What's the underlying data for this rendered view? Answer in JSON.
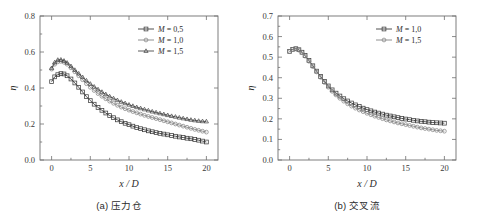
{
  "figure": {
    "panels": [
      {
        "id": "panel-a",
        "caption": "(a) 压力仓",
        "xlabel": "x / D",
        "ylabel": "η"
      },
      {
        "id": "panel-b",
        "caption": "(b) 交叉流",
        "xlabel": "x / D",
        "ylabel": "η"
      }
    ]
  },
  "chart_data": [
    {
      "type": "line",
      "title": "(a) 压力仓",
      "xlabel": "x / D",
      "ylabel": "η",
      "xlim": [
        -1.5,
        21.5
      ],
      "ylim": [
        0.0,
        0.8
      ],
      "xticks": [
        0,
        5,
        10,
        15,
        20
      ],
      "xtick_labels": [
        "0",
        "5",
        "10",
        "15",
        "20"
      ],
      "yticks": [
        0.0,
        0.2,
        0.4,
        0.6,
        0.8
      ],
      "ytick_labels": [
        "0.0",
        "0.2",
        "0.4",
        "0.6",
        "0.8"
      ],
      "grid": false,
      "legend_position": "upper right",
      "series": [
        {
          "name": "M = 0,5",
          "marker": "square",
          "color": "#3d3d3d",
          "x": [
            0.0,
            0.4,
            0.8,
            1.2,
            1.6,
            2.0,
            2.5,
            3.0,
            3.5,
            4.0,
            4.5,
            5.0,
            5.5,
            6.0,
            6.5,
            7.0,
            7.5,
            8.0,
            8.5,
            9.0,
            9.5,
            10.0,
            10.5,
            11.0,
            11.5,
            12.0,
            12.5,
            13.0,
            13.5,
            14.0,
            14.5,
            15.0,
            15.5,
            16.0,
            16.5,
            17.0,
            17.5,
            18.0,
            18.5,
            19.0,
            19.5,
            20.0
          ],
          "y": [
            0.435,
            0.462,
            0.474,
            0.48,
            0.478,
            0.468,
            0.45,
            0.428,
            0.404,
            0.378,
            0.352,
            0.33,
            0.31,
            0.292,
            0.276,
            0.261,
            0.247,
            0.235,
            0.223,
            0.213,
            0.204,
            0.196,
            0.188,
            0.18,
            0.174,
            0.168,
            0.162,
            0.157,
            0.152,
            0.148,
            0.144,
            0.14,
            0.136,
            0.132,
            0.128,
            0.125,
            0.121,
            0.118,
            0.114,
            0.11,
            0.105,
            0.1
          ]
        },
        {
          "name": "M = 1,0",
          "marker": "circle",
          "color": "#858585",
          "x": [
            0.0,
            0.4,
            0.8,
            1.2,
            1.6,
            2.0,
            2.5,
            3.0,
            3.5,
            4.0,
            4.5,
            5.0,
            5.5,
            6.0,
            6.5,
            7.0,
            7.5,
            8.0,
            8.5,
            9.0,
            9.5,
            10.0,
            10.5,
            11.0,
            11.5,
            12.0,
            12.5,
            13.0,
            13.5,
            14.0,
            14.5,
            15.0,
            15.5,
            16.0,
            16.5,
            17.0,
            17.5,
            18.0,
            18.5,
            19.0,
            19.5,
            20.0
          ],
          "y": [
            0.505,
            0.532,
            0.545,
            0.548,
            0.543,
            0.532,
            0.512,
            0.49,
            0.468,
            0.446,
            0.424,
            0.404,
            0.386,
            0.369,
            0.354,
            0.34,
            0.327,
            0.315,
            0.304,
            0.294,
            0.285,
            0.277,
            0.269,
            0.262,
            0.255,
            0.248,
            0.242,
            0.236,
            0.23,
            0.224,
            0.218,
            0.212,
            0.206,
            0.2,
            0.194,
            0.188,
            0.182,
            0.176,
            0.17,
            0.165,
            0.16,
            0.155
          ]
        },
        {
          "name": "M = 1,5",
          "marker": "triangle",
          "color": "#4a4a4a",
          "x": [
            0.0,
            0.4,
            0.8,
            1.2,
            1.6,
            2.0,
            2.5,
            3.0,
            3.5,
            4.0,
            4.5,
            5.0,
            5.5,
            6.0,
            6.5,
            7.0,
            7.5,
            8.0,
            8.5,
            9.0,
            9.5,
            10.0,
            10.5,
            11.0,
            11.5,
            12.0,
            12.5,
            13.0,
            13.5,
            14.0,
            14.5,
            15.0,
            15.5,
            16.0,
            16.5,
            17.0,
            17.5,
            18.0,
            18.5,
            19.0,
            19.5,
            20.0
          ],
          "y": [
            0.51,
            0.542,
            0.556,
            0.557,
            0.551,
            0.54,
            0.521,
            0.5,
            0.48,
            0.46,
            0.441,
            0.423,
            0.407,
            0.392,
            0.378,
            0.365,
            0.353,
            0.342,
            0.332,
            0.323,
            0.315,
            0.307,
            0.3,
            0.293,
            0.287,
            0.281,
            0.275,
            0.269,
            0.264,
            0.259,
            0.254,
            0.249,
            0.244,
            0.24,
            0.235,
            0.231,
            0.227,
            0.223,
            0.22,
            0.217,
            0.215,
            0.214
          ]
        }
      ]
    },
    {
      "type": "line",
      "title": "(b) 交叉流",
      "xlabel": "x / D",
      "ylabel": "η",
      "xlim": [
        -1.5,
        21.5
      ],
      "ylim": [
        0.0,
        0.7
      ],
      "xticks": [
        0,
        5,
        10,
        15,
        20
      ],
      "xtick_labels": [
        "0",
        "5",
        "10",
        "15",
        "20"
      ],
      "yticks": [
        0.0,
        0.1,
        0.2,
        0.3,
        0.4,
        0.5,
        0.6,
        0.7
      ],
      "ytick_labels": [
        "0.0",
        "0.1",
        "0.2",
        "0.3",
        "0.4",
        "0.5",
        "0.6",
        "0.7"
      ],
      "grid": false,
      "legend_position": "upper right",
      "series": [
        {
          "name": "M = 1,0",
          "marker": "square",
          "color": "#3d3d3d",
          "x": [
            0.0,
            0.4,
            0.8,
            1.2,
            1.6,
            2.0,
            2.5,
            3.0,
            3.5,
            4.0,
            4.5,
            5.0,
            5.5,
            6.0,
            6.5,
            7.0,
            7.5,
            8.0,
            8.5,
            9.0,
            9.5,
            10.0,
            10.5,
            11.0,
            11.5,
            12.0,
            12.5,
            13.0,
            13.5,
            14.0,
            14.5,
            15.0,
            15.5,
            16.0,
            16.5,
            17.0,
            17.5,
            18.0,
            18.5,
            19.0,
            19.5,
            20.0
          ],
          "y": [
            0.528,
            0.538,
            0.541,
            0.536,
            0.524,
            0.508,
            0.484,
            0.458,
            0.432,
            0.406,
            0.382,
            0.36,
            0.341,
            0.325,
            0.311,
            0.298,
            0.287,
            0.277,
            0.268,
            0.26,
            0.252,
            0.245,
            0.239,
            0.233,
            0.228,
            0.223,
            0.218,
            0.214,
            0.21,
            0.206,
            0.202,
            0.199,
            0.196,
            0.193,
            0.19,
            0.188,
            0.186,
            0.184,
            0.182,
            0.181,
            0.18,
            0.179
          ]
        },
        {
          "name": "M = 1,5",
          "marker": "circle",
          "color": "#858585",
          "x": [
            0.0,
            0.4,
            0.8,
            1.2,
            1.6,
            2.0,
            2.5,
            3.0,
            3.5,
            4.0,
            4.5,
            5.0,
            5.5,
            6.0,
            6.5,
            7.0,
            7.5,
            8.0,
            8.5,
            9.0,
            9.5,
            10.0,
            10.5,
            11.0,
            11.5,
            12.0,
            12.5,
            13.0,
            13.5,
            14.0,
            14.5,
            15.0,
            15.5,
            16.0,
            16.5,
            17.0,
            17.5,
            18.0,
            18.5,
            19.0,
            19.5,
            20.0
          ],
          "y": [
            0.527,
            0.537,
            0.54,
            0.534,
            0.522,
            0.505,
            0.48,
            0.454,
            0.428,
            0.402,
            0.377,
            0.354,
            0.334,
            0.316,
            0.3,
            0.286,
            0.273,
            0.262,
            0.252,
            0.243,
            0.235,
            0.227,
            0.22,
            0.213,
            0.207,
            0.201,
            0.195,
            0.19,
            0.185,
            0.18,
            0.176,
            0.172,
            0.168,
            0.164,
            0.16,
            0.156,
            0.153,
            0.15,
            0.147,
            0.144,
            0.142,
            0.14
          ]
        }
      ]
    }
  ]
}
